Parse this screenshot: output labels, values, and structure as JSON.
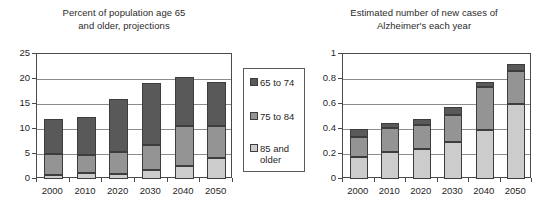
{
  "legend": {
    "entries": [
      {
        "label": "65 to 74",
        "color": "#595959"
      },
      {
        "label": "75 to 84",
        "color": "#949494"
      },
      {
        "label": "85 and\nolder",
        "color": "#cccccc"
      }
    ]
  },
  "chart_data": [
    {
      "type": "bar",
      "stacked": true,
      "title": "Percent of population age 65 and older, projections",
      "title_line1": "Percent of population age 65",
      "title_line2": "and older, projections",
      "xlabel": "",
      "ylabel": "",
      "categories": [
        "2000",
        "2010",
        "2020",
        "2030",
        "2040",
        "2050"
      ],
      "ylim": [
        0,
        25
      ],
      "yticks": [
        0,
        5,
        10,
        15,
        20,
        25
      ],
      "ytick_labels": [
        "0",
        "5",
        "10",
        "15",
        "20",
        "25"
      ],
      "grid": true,
      "legend_position": "right",
      "series": [
        {
          "name": "85 and older",
          "color": "#cccccc",
          "values": [
            0.9,
            1.2,
            1.1,
            1.8,
            2.7,
            4.3
          ]
        },
        {
          "name": "75 to 84",
          "color": "#949494",
          "values": [
            4.2,
            3.6,
            4.3,
            5.0,
            7.9,
            6.3
          ]
        },
        {
          "name": "65 to 74",
          "color": "#595959",
          "values": [
            6.9,
            7.7,
            10.7,
            12.4,
            9.8,
            8.8
          ]
        }
      ],
      "totals": [
        12.0,
        12.5,
        16.1,
        19.2,
        20.4,
        19.4
      ]
    },
    {
      "type": "bar",
      "stacked": true,
      "title": "Estimated number of new cases of Alzheimer's each year",
      "title_line1": "Estimated number of new cases of",
      "title_line2": "Alzheimer's each year",
      "xlabel": "",
      "ylabel": "",
      "categories": [
        "2000",
        "2010",
        "2020",
        "2030",
        "2040",
        "2050"
      ],
      "ylim": [
        0,
        1
      ],
      "yticks": [
        0,
        0.2,
        0.4,
        0.6,
        0.8,
        1
      ],
      "ytick_labels": [
        "0",
        "0.2",
        "0.4",
        "0.6",
        "0.8",
        "1"
      ],
      "grid": true,
      "legend_position": "none",
      "series": [
        {
          "name": "85 and older",
          "color": "#cccccc",
          "values": [
            0.175,
            0.22,
            0.24,
            0.3,
            0.39,
            0.6
          ]
        },
        {
          "name": "75 to 84",
          "color": "#949494",
          "values": [
            0.16,
            0.185,
            0.19,
            0.21,
            0.345,
            0.265
          ]
        },
        {
          "name": "65 to 74",
          "color": "#595959",
          "values": [
            0.065,
            0.045,
            0.05,
            0.07,
            0.045,
            0.055
          ]
        }
      ],
      "totals": [
        0.4,
        0.45,
        0.48,
        0.58,
        0.78,
        0.92
      ]
    }
  ]
}
